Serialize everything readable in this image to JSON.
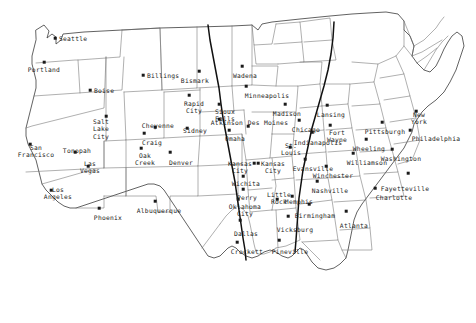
{
  "map": {
    "title": "United States City Map",
    "projection_note": "continental-us",
    "background_color": "#ffffff",
    "border_color": "#3a3a3a",
    "state_line_color": "#6e6e6e",
    "route_color": "#111111",
    "dot_color": "#1a1a1a",
    "label_color": "#1c1c1c"
  },
  "cities": [
    {
      "name": "Seattle",
      "dot_x": 55,
      "dot_y": 38,
      "label_x": 59,
      "label_y": 39,
      "anchor": "lbl-r"
    },
    {
      "name": "Portland",
      "dot_x": 44,
      "dot_y": 62,
      "label_x": 44,
      "label_y": 66,
      "anchor": "lbl-b"
    },
    {
      "name": "Boise",
      "dot_x": 90,
      "dot_y": 90,
      "label_x": 94,
      "label_y": 91,
      "anchor": "lbl-r"
    },
    {
      "name": "Billings",
      "dot_x": 143,
      "dot_y": 75,
      "label_x": 147,
      "label_y": 76,
      "anchor": "lbl-r"
    },
    {
      "name": "Bismark",
      "dot_x": 199,
      "dot_y": 71,
      "label_x": 195,
      "label_y": 77,
      "anchor": "lbl-b"
    },
    {
      "name": "Wadena",
      "dot_x": 242,
      "dot_y": 66,
      "label_x": 245,
      "label_y": 72,
      "anchor": "lbl-b"
    },
    {
      "name": "Rapid\nCity",
      "dot_x": 189,
      "dot_y": 95,
      "label_x": 194,
      "label_y": 100,
      "anchor": "lbl-b"
    },
    {
      "name": "Sioux\nFalls",
      "dot_x": 219,
      "dot_y": 104,
      "label_x": 225,
      "label_y": 108,
      "anchor": "lbl-b"
    },
    {
      "name": "Minneapolis",
      "dot_x": 246,
      "dot_y": 86,
      "label_x": 267,
      "label_y": 92,
      "anchor": "lbl-b"
    },
    {
      "name": "Madison",
      "dot_x": 285,
      "dot_y": 104,
      "label_x": 287,
      "label_y": 110,
      "anchor": "lbl-b"
    },
    {
      "name": "Des Moines",
      "dot_x": 248,
      "dot_y": 126,
      "label_x": 268,
      "label_y": 119,
      "anchor": "lbl-b"
    },
    {
      "name": "Atkinson",
      "dot_x": 219,
      "dot_y": 119,
      "label_x": 227,
      "label_y": 119,
      "anchor": "lbl-b"
    },
    {
      "name": "Omaha",
      "dot_x": 229,
      "dot_y": 130,
      "label_x": 235,
      "label_y": 135,
      "anchor": "lbl-b"
    },
    {
      "name": "Salt\nLake\nCity",
      "dot_x": 106,
      "dot_y": 116,
      "label_x": 101,
      "label_y": 118,
      "anchor": "lbl-b"
    },
    {
      "name": "Cheyenne",
      "dot_x": 155,
      "dot_y": 127,
      "label_x": 158,
      "label_y": 122,
      "anchor": "lbl-b"
    },
    {
      "name": "Sidney",
      "dot_x": 187,
      "dot_y": 128,
      "label_x": 195,
      "label_y": 127,
      "anchor": "lbl-b"
    },
    {
      "name": "Craig",
      "dot_x": 144,
      "dot_y": 133,
      "label_x": 152,
      "label_y": 139,
      "anchor": "lbl-b"
    },
    {
      "name": "Oak\nCreek",
      "dot_x": 141,
      "dot_y": 148,
      "label_x": 145,
      "label_y": 152,
      "anchor": "lbl-b"
    },
    {
      "name": "Denver",
      "dot_x": 170,
      "dot_y": 152,
      "label_x": 181,
      "label_y": 159,
      "anchor": "lbl-b"
    },
    {
      "name": "Tonopah",
      "dot_x": 75,
      "dot_y": 152,
      "label_x": 77,
      "label_y": 147,
      "anchor": "lbl-b"
    },
    {
      "name": "Las\nVegas",
      "dot_x": 88,
      "dot_y": 166,
      "label_x": 90,
      "label_y": 160,
      "anchor": "lbl-b"
    },
    {
      "name": "San\nFrancisco",
      "dot_x": 30,
      "dot_y": 144,
      "label_x": 36,
      "label_y": 144,
      "anchor": "lbl-b"
    },
    {
      "name": "Los\nAngeles",
      "dot_x": 51,
      "dot_y": 190,
      "label_x": 58,
      "label_y": 186,
      "anchor": "lbl-b"
    },
    {
      "name": "Phoenix",
      "dot_x": 99,
      "dot_y": 208,
      "label_x": 108,
      "label_y": 214,
      "anchor": "lbl-b"
    },
    {
      "name": "Albuquerque",
      "dot_x": 155,
      "dot_y": 201,
      "label_x": 159,
      "label_y": 207,
      "anchor": "lbl-b"
    },
    {
      "name": "Kansas\nCity",
      "dot_x": 254,
      "dot_y": 163,
      "label_x": 240,
      "label_y": 160,
      "anchor": "lbl-b"
    },
    {
      "name": "Kansas\nCity",
      "dot_x": 258,
      "dot_y": 163,
      "label_x": 273,
      "label_y": 160,
      "anchor": "lbl-b"
    },
    {
      "name": "Wichita",
      "dot_x": 243,
      "dot_y": 176,
      "label_x": 246,
      "label_y": 180,
      "anchor": "lbl-b"
    },
    {
      "name": "Perry",
      "dot_x": 243,
      "dot_y": 189,
      "label_x": 247,
      "label_y": 194,
      "anchor": "lbl-b"
    },
    {
      "name": "Oklahoma\nCity",
      "dot_x": 238,
      "dot_y": 199,
      "label_x": 245,
      "label_y": 203,
      "anchor": "lbl-b"
    },
    {
      "name": "Little\nRock",
      "dot_x": 277,
      "dot_y": 199,
      "label_x": 279,
      "label_y": 191,
      "anchor": "lbl-b"
    },
    {
      "name": "St.\nLouis",
      "dot_x": 290,
      "dot_y": 147,
      "label_x": 291,
      "label_y": 142,
      "anchor": "lbl-b"
    },
    {
      "name": "Chicago",
      "dot_x": 299,
      "dot_y": 120,
      "label_x": 306,
      "label_y": 126,
      "anchor": "lbl-b"
    },
    {
      "name": "Indianapolis",
      "dot_x": 312,
      "dot_y": 132,
      "label_x": 318,
      "label_y": 139,
      "anchor": "lbl-b"
    },
    {
      "name": "Lansing",
      "dot_x": 327,
      "dot_y": 105,
      "label_x": 331,
      "label_y": 111,
      "anchor": "lbl-b"
    },
    {
      "name": "Fort\nWayne",
      "dot_x": 330,
      "dot_y": 125,
      "label_x": 337,
      "label_y": 129,
      "anchor": "lbl-b"
    },
    {
      "name": "Evansville",
      "dot_x": 305,
      "dot_y": 159,
      "label_x": 313,
      "label_y": 165,
      "anchor": "lbl-b"
    },
    {
      "name": "Winchester",
      "dot_x": 326,
      "dot_y": 166,
      "label_x": 333,
      "label_y": 172,
      "anchor": "lbl-b"
    },
    {
      "name": "Wheeling",
      "dot_x": 366,
      "dot_y": 139,
      "label_x": 369,
      "label_y": 145,
      "anchor": "lbl-b"
    },
    {
      "name": "Williamson",
      "dot_x": 353,
      "dot_y": 153,
      "label_x": 367,
      "label_y": 159,
      "anchor": "lbl-b"
    },
    {
      "name": "Pittsburgh",
      "dot_x": 382,
      "dot_y": 122,
      "label_x": 385,
      "label_y": 128,
      "anchor": "lbl-b"
    },
    {
      "name": "New\nYork",
      "dot_x": 416,
      "dot_y": 111,
      "label_x": 419,
      "label_y": 111,
      "anchor": "lbl-b"
    },
    {
      "name": "Philadelphia",
      "dot_x": 410,
      "dot_y": 130,
      "label_x": 436,
      "label_y": 135,
      "anchor": "lbl-b"
    },
    {
      "name": "Washington",
      "dot_x": 392,
      "dot_y": 149,
      "label_x": 401,
      "label_y": 155,
      "anchor": "lbl-b"
    },
    {
      "name": "Fayetteville",
      "dot_x": 408,
      "dot_y": 173,
      "label_x": 405,
      "label_y": 185,
      "anchor": "lbl-b"
    },
    {
      "name": "Charlotte",
      "dot_x": 375,
      "dot_y": 188,
      "label_x": 394,
      "label_y": 194,
      "anchor": "lbl-b"
    },
    {
      "name": "Nashville",
      "dot_x": 317,
      "dot_y": 181,
      "label_x": 330,
      "label_y": 187,
      "anchor": "lbl-b"
    },
    {
      "name": "Memphis",
      "dot_x": 292,
      "dot_y": 196,
      "label_x": 299,
      "label_y": 198,
      "anchor": "lbl-b"
    },
    {
      "name": "Birmingham",
      "dot_x": 309,
      "dot_y": 204,
      "label_x": 315,
      "label_y": 212,
      "anchor": "lbl-b"
    },
    {
      "name": "Atlanta",
      "dot_x": 346,
      "dot_y": 211,
      "label_x": 354,
      "label_y": 222,
      "anchor": "lbl-b"
    },
    {
      "name": "Vicksburg",
      "dot_x": 288,
      "dot_y": 216,
      "label_x": 295,
      "label_y": 226,
      "anchor": "lbl-b"
    },
    {
      "name": "Dallas",
      "dot_x": 240,
      "dot_y": 220,
      "label_x": 246,
      "label_y": 230,
      "anchor": "lbl-b"
    },
    {
      "name": "Crockett",
      "dot_x": 237,
      "dot_y": 242,
      "label_x": 247,
      "label_y": 248,
      "anchor": "lbl-b"
    },
    {
      "name": "Pineville",
      "dot_x": 279,
      "dot_y": 240,
      "label_x": 290,
      "label_y": 248,
      "anchor": "lbl-b"
    }
  ]
}
